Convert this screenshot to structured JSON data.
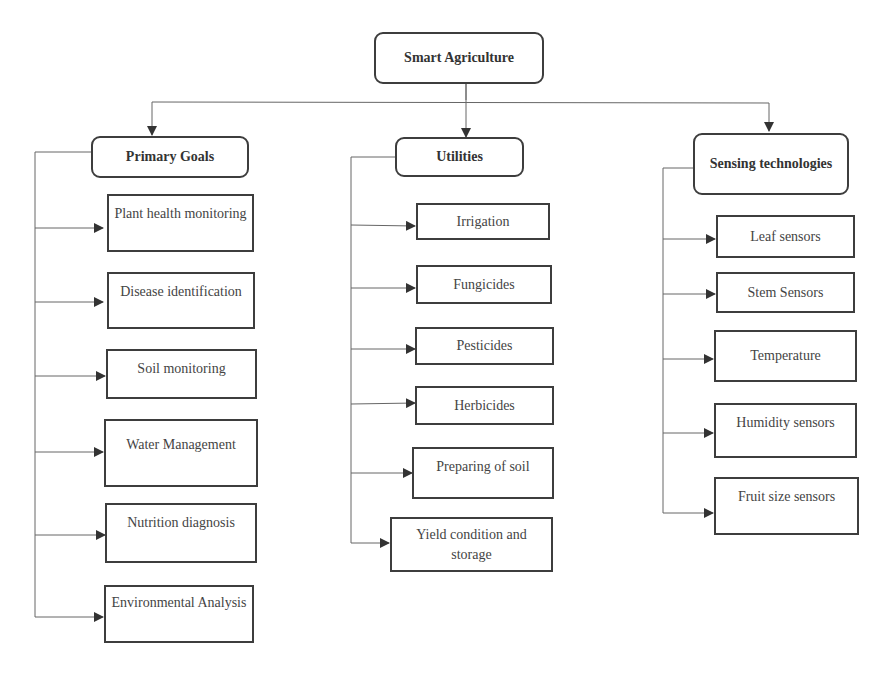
{
  "root": {
    "label": "Smart Agriculture"
  },
  "columns": [
    {
      "title": "Primary Goals",
      "items": [
        "Plant health monitoring",
        "Disease identification",
        "Soil monitoring",
        "Water Management",
        "Nutrition diagnosis",
        "Environmental Analysis"
      ]
    },
    {
      "title": "Utilities",
      "items": [
        "Irrigation",
        "Fungicides",
        "Pesticides",
        "Herbicides",
        "Preparing of soil",
        "Yield condition and storage"
      ]
    },
    {
      "title": "Sensing technologies",
      "items": [
        "Leaf sensors",
        "Stem Sensors",
        "Temperature",
        "Humidity sensors",
        "Fruit size sensors"
      ]
    }
  ]
}
